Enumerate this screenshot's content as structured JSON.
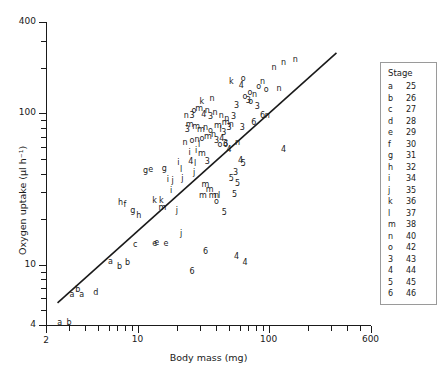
{
  "chart_data": {
    "type": "scatter",
    "title": "",
    "xlabel": "Body mass (mg)",
    "ylabel": "Oxygen uptake (µl h⁻¹)",
    "xscale": "log",
    "yscale": "log",
    "xlim": [
      2,
      600
    ],
    "ylim": [
      4,
      400
    ],
    "grid": false,
    "xticks_major": [
      2,
      10,
      100,
      600
    ],
    "xtick_labels": [
      "2",
      "10",
      "100",
      "600"
    ],
    "xticks_minor": [
      3,
      4,
      5,
      6,
      7,
      8,
      9,
      20,
      30,
      40,
      50,
      60,
      70,
      80,
      90,
      200,
      300,
      400,
      500
    ],
    "yticks_major": [
      4,
      10,
      100,
      400
    ],
    "ytick_labels": [
      "4",
      "10",
      "100",
      "400"
    ],
    "yticks_minor": [
      5,
      6,
      7,
      8,
      9,
      20,
      30,
      40,
      50,
      60,
      70,
      80,
      90,
      200,
      300
    ],
    "legend": {
      "position": "right-outside",
      "title": "Stage",
      "entries": [
        {
          "symbol": "a",
          "stage": "25"
        },
        {
          "symbol": "b",
          "stage": "26"
        },
        {
          "symbol": "c",
          "stage": "27"
        },
        {
          "symbol": "d",
          "stage": "28"
        },
        {
          "symbol": "e",
          "stage": "29"
        },
        {
          "symbol": "f",
          "stage": "30"
        },
        {
          "symbol": "g",
          "stage": "31"
        },
        {
          "symbol": "h",
          "stage": "32"
        },
        {
          "symbol": "i",
          "stage": "34"
        },
        {
          "symbol": "j",
          "stage": "35"
        },
        {
          "symbol": "k",
          "stage": "36"
        },
        {
          "symbol": "l",
          "stage": "37"
        },
        {
          "symbol": "m",
          "stage": "38"
        },
        {
          "symbol": "n",
          "stage": "40"
        },
        {
          "symbol": "o",
          "stage": "42"
        },
        {
          "symbol": "3",
          "stage": "43"
        },
        {
          "symbol": "4",
          "stage": "44"
        },
        {
          "symbol": "5",
          "stage": "45"
        },
        {
          "symbol": "6",
          "stage": "46"
        }
      ]
    },
    "fit_line": {
      "x": [
        2.45,
        330.0
      ],
      "y": [
        5.6,
        250.0
      ],
      "style": "solid",
      "color": "#1a1a1a"
    },
    "points": [
      {
        "label": "a",
        "x": 2.55,
        "y": 4.15
      },
      {
        "label": "a",
        "x": 3.15,
        "y": 6.3
      },
      {
        "label": "b",
        "x": 3.5,
        "y": 6.85
      },
      {
        "label": "a",
        "x": 3.75,
        "y": 6.35
      },
      {
        "label": "d",
        "x": 4.8,
        "y": 6.5
      },
      {
        "label": "b",
        "x": 3.0,
        "y": 4.15
      },
      {
        "label": "a",
        "x": 6.2,
        "y": 10.4
      },
      {
        "label": "b",
        "x": 7.3,
        "y": 9.6
      },
      {
        "label": "b",
        "x": 8.4,
        "y": 10.3
      },
      {
        "label": "c",
        "x": 9.6,
        "y": 13.5
      },
      {
        "label": "e",
        "x": 13.5,
        "y": 13.6
      },
      {
        "label": "e",
        "x": 16.5,
        "y": 13.6
      },
      {
        "label": "g",
        "x": 9.2,
        "y": 22.5
      },
      {
        "label": "h",
        "x": 10.2,
        "y": 21.0
      },
      {
        "label": "h",
        "x": 7.4,
        "y": 25.5
      },
      {
        "label": "f",
        "x": 8.0,
        "y": 24.8
      },
      {
        "label": "g",
        "x": 11.5,
        "y": 41.5
      },
      {
        "label": "e",
        "x": 12.6,
        "y": 42.5
      },
      {
        "label": "g",
        "x": 16.0,
        "y": 43.0
      },
      {
        "label": "i",
        "x": 20.5,
        "y": 47.0
      },
      {
        "label": "k",
        "x": 13.5,
        "y": 26.5
      },
      {
        "label": "k",
        "x": 15.2,
        "y": 26.5
      },
      {
        "label": "m",
        "x": 15.5,
        "y": 23.5
      },
      {
        "label": "j",
        "x": 20.0,
        "y": 22.5
      },
      {
        "label": "i",
        "x": 18.0,
        "y": 30.5
      },
      {
        "label": "i",
        "x": 17.0,
        "y": 36.5
      },
      {
        "label": "j",
        "x": 18.5,
        "y": 35.5
      },
      {
        "label": "l",
        "x": 21.5,
        "y": 42.5
      },
      {
        "label": "j",
        "x": 22.0,
        "y": 37.0
      },
      {
        "label": "i",
        "x": 25.0,
        "y": 55.0
      },
      {
        "label": "i",
        "x": 28.0,
        "y": 56.5
      },
      {
        "label": "l",
        "x": 29.5,
        "y": 62.0
      },
      {
        "label": "m",
        "x": 31.0,
        "y": 54.0
      },
      {
        "label": "4",
        "x": 25.5,
        "y": 47.5
      },
      {
        "label": "l",
        "x": 27.5,
        "y": 46.5
      },
      {
        "label": "j",
        "x": 27.0,
        "y": 40.5
      },
      {
        "label": "3",
        "x": 34.0,
        "y": 48.0
      },
      {
        "label": "m",
        "x": 33.0,
        "y": 33.5
      },
      {
        "label": "m",
        "x": 35.5,
        "y": 31.0
      },
      {
        "label": "m",
        "x": 31.5,
        "y": 28.5
      },
      {
        "label": "m",
        "x": 37.5,
        "y": 28.5
      },
      {
        "label": "n",
        "x": 40.0,
        "y": 28.5
      },
      {
        "label": "l",
        "x": 42.0,
        "y": 28.5
      },
      {
        "label": "o",
        "x": 40.0,
        "y": 26.0
      },
      {
        "label": "5",
        "x": 46.0,
        "y": 22.0
      },
      {
        "label": "5",
        "x": 52.0,
        "y": 37.0
      },
      {
        "label": "3",
        "x": 56.0,
        "y": 40.5
      },
      {
        "label": "5",
        "x": 58.0,
        "y": 34.0
      },
      {
        "label": "5",
        "x": 55.0,
        "y": 29.0
      },
      {
        "label": "4",
        "x": 61.0,
        "y": 48.5
      },
      {
        "label": "5",
        "x": 64.0,
        "y": 46.0
      },
      {
        "label": "4",
        "x": 50.0,
        "y": 57.0
      },
      {
        "label": "3",
        "x": 47.0,
        "y": 63.0
      },
      {
        "label": "4",
        "x": 44.0,
        "y": 68.0
      },
      {
        "label": "l",
        "x": 43.0,
        "y": 78.0
      },
      {
        "label": "3",
        "x": 45.5,
        "y": 74.0
      },
      {
        "label": "m",
        "x": 41.0,
        "y": 82.0
      },
      {
        "label": "m",
        "x": 47.0,
        "y": 86.0
      },
      {
        "label": "3",
        "x": 50.0,
        "y": 80.0
      },
      {
        "label": "n",
        "x": 52.0,
        "y": 84.0
      },
      {
        "label": "n",
        "x": 48.0,
        "y": 92.0
      },
      {
        "label": "3",
        "x": 54.0,
        "y": 95.0
      },
      {
        "label": "n",
        "x": 43.5,
        "y": 96.0
      },
      {
        "label": "n",
        "x": 39.0,
        "y": 100.0
      },
      {
        "label": "3",
        "x": 36.0,
        "y": 95.0
      },
      {
        "label": "n",
        "x": 34.0,
        "y": 104.0
      },
      {
        "label": "k",
        "x": 31.0,
        "y": 118.0
      },
      {
        "label": "n",
        "x": 37.0,
        "y": 124.0
      },
      {
        "label": "m",
        "x": 29.5,
        "y": 106.0
      },
      {
        "label": "o",
        "x": 27.0,
        "y": 104.0
      },
      {
        "label": "4",
        "x": 32.0,
        "y": 98.0
      },
      {
        "label": "3",
        "x": 26.0,
        "y": 96.0
      },
      {
        "label": "n",
        "x": 23.5,
        "y": 96.0
      },
      {
        "label": "m",
        "x": 25.0,
        "y": 84.0
      },
      {
        "label": "m",
        "x": 28.0,
        "y": 81.0
      },
      {
        "label": "3",
        "x": 24.0,
        "y": 78.0
      },
      {
        "label": "m",
        "x": 30.5,
        "y": 78.0
      },
      {
        "label": "n",
        "x": 33.0,
        "y": 80.0
      },
      {
        "label": "o",
        "x": 36.0,
        "y": 76.0
      },
      {
        "label": "n",
        "x": 38.0,
        "y": 72.0
      },
      {
        "label": "m",
        "x": 34.5,
        "y": 70.0
      },
      {
        "label": "o",
        "x": 31.0,
        "y": 68.0
      },
      {
        "label": "n",
        "x": 28.5,
        "y": 67.0
      },
      {
        "label": "o",
        "x": 26.0,
        "y": 66.0
      },
      {
        "label": "n",
        "x": 23.0,
        "y": 64.0
      },
      {
        "label": "3",
        "x": 40.0,
        "y": 66.0
      },
      {
        "label": "o",
        "x": 42.5,
        "y": 62.0
      },
      {
        "label": "6",
        "x": 47.0,
        "y": 62.0
      },
      {
        "label": "n",
        "x": 58.0,
        "y": 64.0
      },
      {
        "label": "3",
        "x": 63.0,
        "y": 80.0
      },
      {
        "label": "3",
        "x": 70.0,
        "y": 120.0
      },
      {
        "label": "o",
        "x": 66.0,
        "y": 128.0
      },
      {
        "label": "o",
        "x": 72.0,
        "y": 136.0
      },
      {
        "label": "n",
        "x": 78.0,
        "y": 132.0
      },
      {
        "label": "o",
        "x": 84.0,
        "y": 150.0
      },
      {
        "label": "n",
        "x": 90.0,
        "y": 160.0
      },
      {
        "label": "o",
        "x": 96.0,
        "y": 142.0
      },
      {
        "label": "4",
        "x": 62.0,
        "y": 152.0
      },
      {
        "label": "o",
        "x": 64.0,
        "y": 168.0
      },
      {
        "label": "k",
        "x": 52.0,
        "y": 160.0
      },
      {
        "label": "3",
        "x": 57.0,
        "y": 112.0
      },
      {
        "label": "o",
        "x": 73.0,
        "y": 118.0
      },
      {
        "label": "3",
        "x": 82.0,
        "y": 110.0
      },
      {
        "label": "n",
        "x": 110.0,
        "y": 200.0
      },
      {
        "label": "n",
        "x": 130.0,
        "y": 215.0
      },
      {
        "label": "n",
        "x": 160.0,
        "y": 225.0
      },
      {
        "label": "n",
        "x": 120.0,
        "y": 145.0
      },
      {
        "label": "n",
        "x": 98.0,
        "y": 96.0
      },
      {
        "label": "6",
        "x": 90.0,
        "y": 96.0
      },
      {
        "label": "6",
        "x": 77.0,
        "y": 86.0
      },
      {
        "label": "4",
        "x": 130.0,
        "y": 57.0
      },
      {
        "label": "j",
        "x": 21.5,
        "y": 16.0
      },
      {
        "label": "e",
        "x": 14.0,
        "y": 14.0
      },
      {
        "label": "6",
        "x": 33.0,
        "y": 12.2
      },
      {
        "label": "6",
        "x": 26.0,
        "y": 8.9
      },
      {
        "label": "4",
        "x": 57.0,
        "y": 11.2
      },
      {
        "label": "4",
        "x": 66.0,
        "y": 10.3
      }
    ]
  }
}
